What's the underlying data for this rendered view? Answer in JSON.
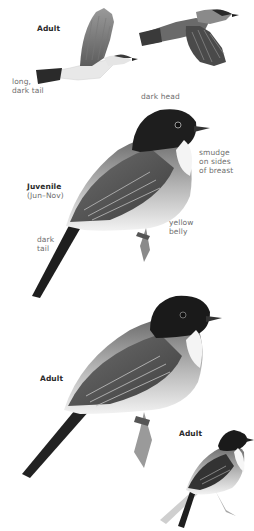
{
  "plate": {
    "subject": "bird field guide illustration",
    "colors": {
      "background": "#ffffff",
      "label_text": "#6e6e6e",
      "heading_text": "#2a2a2a",
      "dark_head": "#1e1e1e",
      "back": "#5a5a5a",
      "belly": "#f0f0f0"
    }
  },
  "flight_group": {
    "heading": "Adult",
    "annotations": {
      "tail": "long,\ndark tail"
    }
  },
  "juvenile_group": {
    "heading": "Juvenile",
    "season": "(Jun–Nov)",
    "annotations": {
      "head": "dark head",
      "breast": "smudge\non sides\nof breast",
      "belly": "yellow\nbelly",
      "tail": "dark\ntail"
    }
  },
  "adult_perched_group": {
    "heading": "Adult"
  },
  "adult_small_group": {
    "heading": "Adult"
  }
}
